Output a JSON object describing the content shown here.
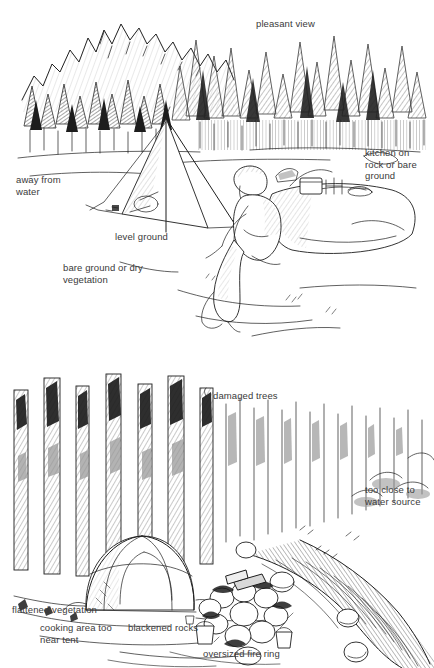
{
  "document": {
    "kind": "line-illustration",
    "title": "Choosing a campsite: good site versus poor site",
    "background_color": "#ffffff",
    "ink_color": "#1d1d1d",
    "label_color": "#3a3a3a",
    "panel_count": 2
  },
  "panels": [
    {
      "id": "good-campsite",
      "name": "good campsite",
      "scene_elements": [
        "mountain-ridge",
        "conifer-forest",
        "a-frame-tent",
        "seated-camper",
        "large-boulder",
        "camp-kitchen-on-rock",
        "open-bare-ground"
      ],
      "labels": [
        {
          "id": "pleasant-view",
          "text": "pleasant view",
          "x": 256,
          "y": 18,
          "align": "left"
        },
        {
          "id": "kitchen-on-rock",
          "text": "kitchen on\nrock or bare\nground",
          "x": 365,
          "y": 147,
          "align": "left"
        },
        {
          "id": "away-from-water",
          "text": "away from\nwater",
          "x": 16,
          "y": 174,
          "align": "left"
        },
        {
          "id": "level-ground",
          "text": "level ground",
          "x": 115,
          "y": 231,
          "align": "left"
        },
        {
          "id": "bare-ground",
          "text": "bare ground or dry\nvegetation",
          "x": 63,
          "y": 262,
          "align": "left"
        }
      ]
    },
    {
      "id": "poor-campsite",
      "name": "poor campsite",
      "scene_elements": [
        "damaged-tree-trunks",
        "dome-tent",
        "flattened-vegetation",
        "oversized-fire-ring",
        "blackened-rocks",
        "cook-pots",
        "stream-bank",
        "boulders-in-creek"
      ],
      "labels": [
        {
          "id": "damaged-trees",
          "text": "damaged trees",
          "x": 213,
          "y": 390,
          "align": "left"
        },
        {
          "id": "too-close-water",
          "text": "too close to\nwater source",
          "x": 365,
          "y": 484,
          "align": "left"
        },
        {
          "id": "flattened-veg",
          "text": "flattened vegetation",
          "x": 12,
          "y": 604,
          "align": "left"
        },
        {
          "id": "cooking-area",
          "text": "cooking area too\nnear tent",
          "x": 40,
          "y": 622,
          "align": "left"
        },
        {
          "id": "blackened-rocks",
          "text": "blackened rocks",
          "x": 128,
          "y": 622,
          "align": "left"
        },
        {
          "id": "oversized-fire",
          "text": "oversized fire ring",
          "x": 203,
          "y": 648,
          "align": "left"
        }
      ]
    }
  ]
}
